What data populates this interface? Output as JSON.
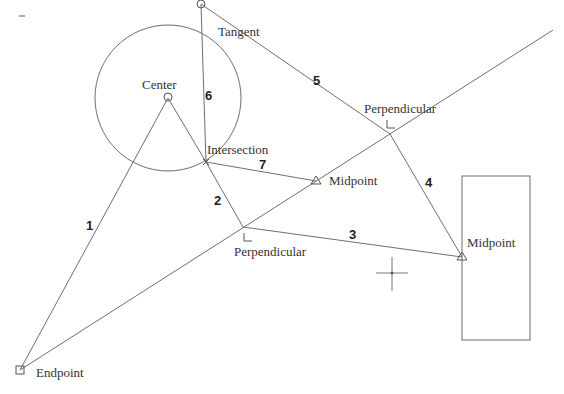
{
  "canvas": {
    "background": "#ffffff",
    "line_color": "#6e6e6e",
    "dash_mark": "–"
  },
  "snap_labels": {
    "tangent": "Tangent",
    "center": "Center",
    "intersection": "Intersection",
    "perpendicular_top": "Perpendicular",
    "perpendicular_bottom": "Perpendicular",
    "midpoint_mid": "Midpoint",
    "midpoint_rect": "Midpoint",
    "endpoint": "Endpoint"
  },
  "segment_numbers": {
    "s1": "1",
    "s2": "2",
    "s3": "3",
    "s4": "4",
    "s5": "5",
    "s6": "6",
    "s7": "7"
  },
  "markers": {
    "tangent": "square-circle-marker",
    "center": "circle-marker",
    "midpoint": "triangle-marker",
    "perpendicular": "right-angle-marker",
    "endpoint": "square-marker",
    "cursor": "crosshair"
  }
}
